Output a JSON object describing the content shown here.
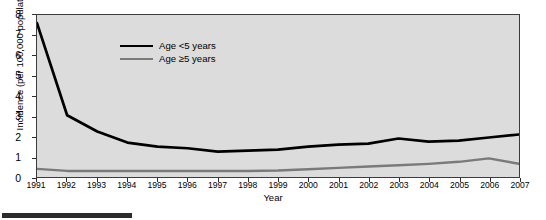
{
  "chart_data": {
    "type": "line",
    "title": "",
    "xlabel": "Year",
    "ylabel": "Incidence (per 100,000 population)",
    "x": [
      1991,
      1992,
      1993,
      1994,
      1995,
      1996,
      1997,
      1998,
      1999,
      2000,
      2001,
      2002,
      2003,
      2004,
      2005,
      2006,
      2007
    ],
    "xtick_labels": [
      "1991",
      "1992",
      "1993",
      "1994",
      "1995",
      "1996",
      "1997",
      "1998",
      "1999",
      "2000",
      "2001",
      "2002",
      "2003",
      "2004",
      "2005",
      "2006",
      "2007"
    ],
    "ytick_labels": [
      "0",
      "1",
      "2",
      "3",
      "4",
      "5",
      "6",
      "7",
      "8"
    ],
    "ytick_values": [
      0,
      1,
      2,
      3,
      4,
      5,
      6,
      7,
      8
    ],
    "xlim": [
      1991,
      2007
    ],
    "ylim": [
      0,
      8
    ],
    "grid": false,
    "legend_position": "upper-left-inside",
    "series": [
      {
        "name": "Age <5 years",
        "color": "#000000",
        "values": [
          7.6,
          3.05,
          2.25,
          1.7,
          1.5,
          1.42,
          1.25,
          1.3,
          1.35,
          1.5,
          1.6,
          1.65,
          1.9,
          1.75,
          1.8,
          1.95,
          2.1
        ]
      },
      {
        "name": "Age ≥5 years",
        "color": "#7a7a7a",
        "values": [
          0.4,
          0.3,
          0.3,
          0.3,
          0.3,
          0.3,
          0.3,
          0.3,
          0.32,
          0.38,
          0.45,
          0.52,
          0.58,
          0.65,
          0.75,
          0.92,
          0.65
        ]
      }
    ]
  },
  "legend": {
    "items": [
      {
        "label": "Age <5 years",
        "color": "#000000"
      },
      {
        "label": "Age ≥5 years",
        "color": "#7a7a7a"
      }
    ]
  },
  "caption": {
    "text": ""
  }
}
